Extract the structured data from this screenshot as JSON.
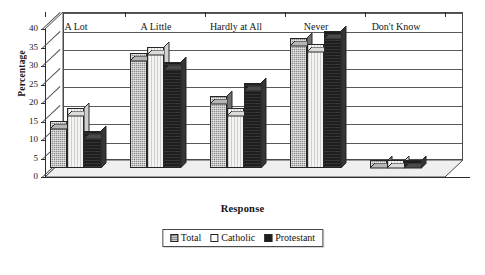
{
  "chart_data": {
    "type": "bar",
    "title": "",
    "xlabel": "Response",
    "ylabel": "Percentage",
    "ylim": [
      0,
      40
    ],
    "ytick_step": 5,
    "yticks": [
      0,
      5,
      10,
      15,
      20,
      25,
      30,
      35,
      40
    ],
    "grid": true,
    "legend_position": "bottom-center",
    "three_d": true,
    "categories": [
      "A Lot",
      "A Little",
      "Hardly at All",
      "Never",
      "Don't Know"
    ],
    "series": [
      {
        "name": "Total",
        "color": "#8e8e8e",
        "values": [
          12.5,
          31.0,
          19.5,
          35.0,
          2.0
        ]
      },
      {
        "name": "Catholic",
        "color": "#f4f4f2",
        "values": [
          16.0,
          32.5,
          16.0,
          33.5,
          2.0
        ]
      },
      {
        "name": "Protestant",
        "color": "#1e1e1e",
        "values": [
          10.0,
          28.5,
          23.0,
          37.0,
          2.0
        ]
      }
    ]
  },
  "axes": {
    "y_title": "Percentage",
    "x_title": "Response"
  },
  "legend": {
    "entries": [
      {
        "label": "Total",
        "swatch": "swatch-total"
      },
      {
        "label": "Catholic",
        "swatch": "swatch-catholic"
      },
      {
        "label": "Protestant",
        "swatch": "swatch-protestant"
      }
    ]
  },
  "colors": {
    "total": "#8e8e8e",
    "catholic": "#f4f4f2",
    "protestant": "#1e1e1e",
    "axis": "#2b2b2b",
    "grid": "#5a5a5a",
    "background": "#ffffff"
  }
}
